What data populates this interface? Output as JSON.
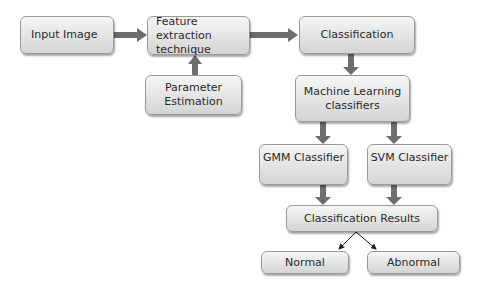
{
  "diagram": {
    "nodes": {
      "input": "Input Image",
      "feature": "Feature extraction technique",
      "parameter": "Parameter Estimation",
      "classification": "Classification",
      "ml": "Machine Learning classifiers",
      "gmm": "GMM Classifier",
      "svm": "SVM Classifier",
      "results": "Classification Results",
      "normal": "Normal",
      "abnormal": "Abnormal"
    },
    "colors": {
      "arrow": "#6e6e6e",
      "box_top": "#f6f6f6",
      "box_bottom": "#d4d4d4",
      "text": "#2a2a2a"
    }
  }
}
